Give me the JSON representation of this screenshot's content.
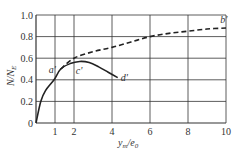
{
  "chart_data": {
    "type": "line",
    "title": "",
    "xlabel": "y_m/e_0",
    "ylabel": "N/N_E",
    "xlim": [
      0,
      10
    ],
    "ylim": [
      0,
      1.0
    ],
    "grid": true,
    "x_ticks": [
      0,
      1,
      2,
      4,
      6,
      8,
      10
    ],
    "x_tick_labels": [
      "1",
      "2",
      "4",
      "6",
      "8",
      "10"
    ],
    "y_ticks": [
      0,
      0.2,
      0.4,
      0.6,
      0.8,
      1.0
    ],
    "y_tick_labels": [
      "0",
      "0.2",
      "0.4",
      "0.6",
      "0.8",
      "1.0"
    ],
    "series": [
      {
        "name": "solid curve (0-a'-c'-d')",
        "style": "solid",
        "x": [
          0,
          0.25,
          0.5,
          0.95,
          1.3,
          1.8,
          2.3,
          2.8,
          3.3,
          3.8,
          4.3
        ],
        "y": [
          0,
          0.2,
          0.3,
          0.4,
          0.5,
          0.55,
          0.57,
          0.56,
          0.52,
          0.47,
          0.42
        ]
      },
      {
        "name": "dashed curve (a'-b')",
        "style": "dashed",
        "x": [
          1.3,
          2,
          3,
          4,
          5,
          6,
          7,
          8,
          9,
          10
        ],
        "y": [
          0.5,
          0.6,
          0.66,
          0.7,
          0.75,
          0.8,
          0.83,
          0.85,
          0.87,
          0.88
        ]
      }
    ],
    "annotations": [
      {
        "text": "a'",
        "x": 1.3,
        "y": 0.5
      },
      {
        "text": "c'",
        "x": 2.3,
        "y": 0.55
      },
      {
        "text": "d'",
        "x": 4.3,
        "y": 0.42
      },
      {
        "text": "b'",
        "x": 9.8,
        "y": 0.9
      }
    ]
  },
  "labels": {
    "ylabel_main": "N/N",
    "ylabel_sub": "E",
    "xlabel_main": "y",
    "xlabel_sub1": "m",
    "xlabel_mid": "/e",
    "xlabel_sub2": "0"
  }
}
